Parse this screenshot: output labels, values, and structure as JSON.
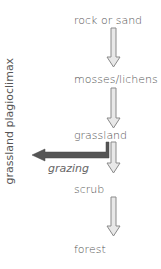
{
  "diagram": {
    "stages": [
      "rock or sand",
      "mosses/lichens",
      "grassland",
      "scrub",
      "forest"
    ],
    "deflection_label": "grazing",
    "plagioclimax_label": "grassland plagioclimax",
    "colors": {
      "text": "#555555",
      "succession_arrow": "#9a9a9a",
      "deflection_arrow": "#555555"
    }
  }
}
